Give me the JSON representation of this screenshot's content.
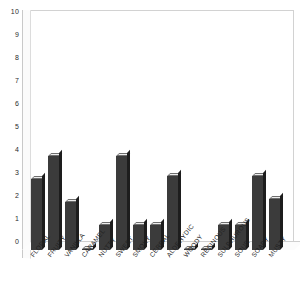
{
  "chart_data": {
    "type": "bar",
    "title": "",
    "subtitle": "",
    "xlabel": "",
    "ylabel": "",
    "ylim": [
      0,
      10
    ],
    "ytick_labels": [
      "10",
      "9",
      "8",
      "7",
      "6",
      "5",
      "4",
      "3",
      "2",
      "1",
      "0"
    ],
    "yticks": [
      10,
      9,
      8,
      7,
      6,
      5,
      4,
      3,
      2,
      1,
      0
    ],
    "grid": false,
    "legend": null,
    "legend_position": "none",
    "bar_color": "#3b3b3b",
    "bar_top_color": "#ededed",
    "bar_side_color": "#1d1d1d",
    "axis_color": "#d2d2d2",
    "background_color": "#ffffff",
    "categories": [
      "FLORAL",
      "FRUITY",
      "VANILLA",
      "CARAMEL",
      "NUTTY",
      "SWEET",
      "SMOKY",
      "CEREAL",
      "ALDEHYDIC",
      "WOODY",
      "RESINOUS",
      "SULPHUROUS",
      "SOUR",
      "SOAPY",
      "MUSTY"
    ],
    "values": [
      3.1,
      4.1,
      2.1,
      0,
      1.1,
      4.1,
      1.1,
      1.1,
      3.2,
      0,
      0,
      1.1,
      1.1,
      3.2,
      2.2
    ]
  }
}
